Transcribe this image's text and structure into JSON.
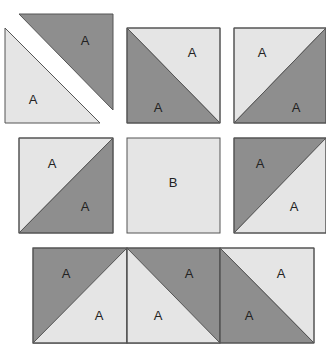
{
  "colors": {
    "dark": "#8e8e8e",
    "light": "#e5e5e5",
    "stroke": "#555555"
  },
  "row1": {
    "split_triangles": {
      "top_dark_label": "A",
      "bottom_light_label": "A"
    },
    "square2": {
      "top_right_light_label": "A",
      "bottom_left_dark_label": "A"
    },
    "square3": {
      "top_left_light_label": "A",
      "bottom_right_dark_label": "A"
    }
  },
  "row2": {
    "square1": {
      "top_left_light_label": "A",
      "bottom_right_dark_label": "A"
    },
    "square2": {
      "center_label": "B"
    },
    "square3": {
      "top_left_dark_label": "A",
      "bottom_right_light_label": "A"
    }
  },
  "row3": {
    "square1": {
      "top_left_dark_label": "A",
      "bottom_right_light_label": "A"
    },
    "square2": {
      "top_right_dark_label": "A",
      "bottom_left_light_label": "A"
    },
    "square3": {
      "top_right_light_label": "A",
      "bottom_left_dark_label": "A"
    }
  }
}
